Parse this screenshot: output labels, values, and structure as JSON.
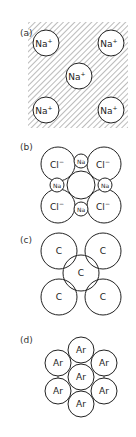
{
  "panels": [
    {
      "label": "(a)",
      "ions": [
        "Na+",
        "Na+",
        "Na+",
        "Na+",
        "Na+"
      ],
      "description": "Metallic bonding: Na+ ions in sea of electrons (hatched)"
    },
    {
      "label": "(b)",
      "large_ions": [
        "Cl−",
        "Cl−",
        "Cl−",
        "Cl−"
      ],
      "small_ions": [
        "Na",
        "Na",
        "Na",
        "Na"
      ],
      "description": "Ionic crystal NaCl"
    },
    {
      "label": "(c)",
      "atoms": [
        "C",
        "C",
        "C",
        "C",
        "C"
      ],
      "description": "Covalent bonding, overlapping C atoms"
    },
    {
      "label": "(d)",
      "atoms": [
        "Ar",
        "Ar",
        "Ar",
        "Ar",
        "Ar",
        "Ar",
        "Ar"
      ],
      "description": "Van der Waals close packing of Ar atoms"
    }
  ],
  "text": {
    "na_plus": "Na",
    "plus_sup": "+",
    "cl": "Cl",
    "minus_sup": "−",
    "na_small": "Na",
    "c": "C",
    "ar": "Ar"
  }
}
